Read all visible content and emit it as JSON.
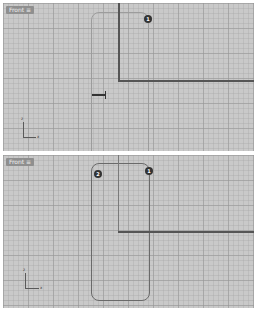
{
  "viewports": [
    {
      "id": "top",
      "label": "Front ≡",
      "markers": [
        {
          "text": "1"
        }
      ],
      "axis": {
        "x_label": "x",
        "z_label": "z"
      }
    },
    {
      "id": "bottom",
      "label": "Front ≡",
      "markers": [
        {
          "text": "2"
        },
        {
          "text": "1"
        }
      ],
      "axis": {
        "x_label": "x",
        "z_label": "z"
      }
    }
  ],
  "colors": {
    "viewport_bg": "#c9c9c9",
    "curve": "#555555",
    "label_bg": "#8f8f8f"
  }
}
